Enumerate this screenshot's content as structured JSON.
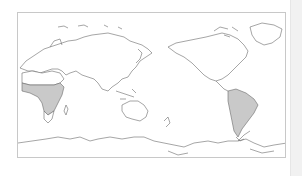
{
  "map": {
    "projection": "equirectangular, Pacific-centered",
    "frame_color": "#c8c8c8",
    "coastline_color": "#6a6a6a",
    "highlight_color": "#c9c9c9",
    "highlighted_regions": [
      {
        "name": "Sub-Saharan Africa",
        "shaded": true
      },
      {
        "name": "South America",
        "shaded": true
      }
    ],
    "visible_regions": [
      "Europe",
      "Asia",
      "Africa",
      "Australia",
      "North America",
      "South America",
      "Antarctica",
      "Greenland"
    ]
  },
  "scrollbar": {
    "visible": true,
    "color": "#f1f1f1"
  }
}
